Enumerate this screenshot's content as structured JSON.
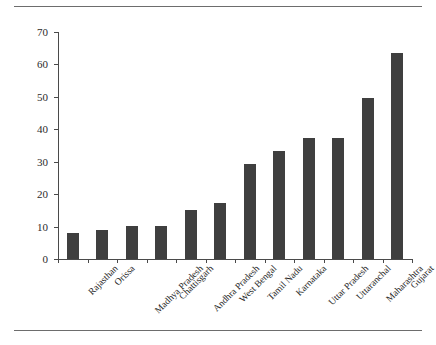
{
  "chart_data": {
    "type": "bar",
    "title": "",
    "subtitle": "",
    "xlabel": "",
    "ylabel": "",
    "ylim": [
      0,
      70
    ],
    "ytick_step": 10,
    "yticks": [
      0,
      10,
      20,
      30,
      40,
      50,
      60,
      70
    ],
    "grid": false,
    "legend": null,
    "bar_color": "#3f3f3f",
    "axis_color": "#4a4a4a",
    "categories": [
      "Rajasthan",
      "Orissa",
      "Madhya Pradesh",
      "Chattisgarh",
      "Andhra Pradesh",
      "West Bengal",
      "Tamil Nadu",
      "Karnataka",
      "Uttar Pradesh",
      "Uttaranchal",
      "Maharashtra",
      "Gujarat"
    ],
    "values": [
      8.0,
      9.1,
      10.1,
      10.2,
      15.2,
      17.2,
      29.2,
      33.3,
      37.3,
      37.3,
      49.5,
      63.4
    ]
  }
}
